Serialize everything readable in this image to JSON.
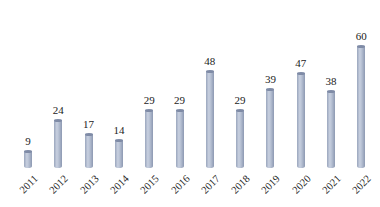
{
  "chart_data": {
    "type": "bar",
    "title": "",
    "xlabel": "",
    "ylabel": "",
    "categories": [
      "2011",
      "2012",
      "2013",
      "2014",
      "2015",
      "2016",
      "2017",
      "2018",
      "2019",
      "2020",
      "2021",
      "2022"
    ],
    "values": [
      9,
      24,
      17,
      14,
      29,
      29,
      48,
      29,
      39,
      47,
      38,
      60
    ],
    "data_labels": true,
    "grid": false,
    "legend": null,
    "ylim": [
      0,
      60
    ],
    "bar_style": "3d-cylinder",
    "bar_color": "#aab4c8"
  }
}
